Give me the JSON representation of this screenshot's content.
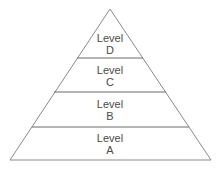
{
  "diagram": {
    "type": "pyramid",
    "levels": [
      {
        "line1": "Level",
        "line2": "D"
      },
      {
        "line1": "Level",
        "line2": "C"
      },
      {
        "line1": "Level",
        "line2": "B"
      },
      {
        "line1": "Level",
        "line2": "A"
      }
    ],
    "colors": {
      "stroke": "#8a8a8a",
      "text": "#4a4a4a",
      "background": "#ffffff"
    }
  }
}
